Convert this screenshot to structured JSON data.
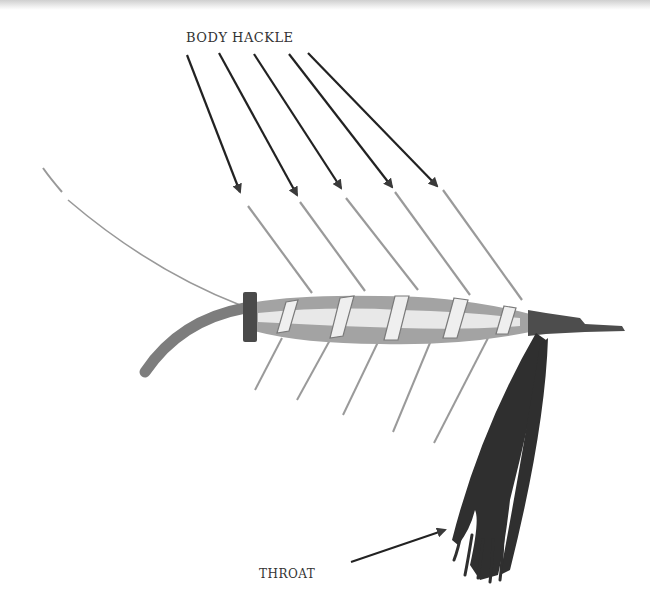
{
  "diagram": {
    "labels": {
      "body_hackle": "BODY HACKLE",
      "throat": "THROAT"
    },
    "parts": [
      {
        "name": "tail",
        "description": "thin curved tail fiber"
      },
      {
        "name": "hook-bend",
        "description": "thick curved shank rear"
      },
      {
        "name": "butt-wrap",
        "description": "dark thread wrap at rear of body"
      },
      {
        "name": "body",
        "description": "tinsel-ribbed body with spiral wraps"
      },
      {
        "name": "body-hackle",
        "description": "five hackle fibers above and below body",
        "count": 5
      },
      {
        "name": "head",
        "description": "dark thread head at hook eye"
      },
      {
        "name": "throat",
        "description": "dark bundle of fibers hanging below head"
      }
    ],
    "arrows": {
      "body_hackle_count": 5,
      "throat_count": 1
    },
    "colors": {
      "ink": "#222222",
      "hackle": "#8a8a8a",
      "body": "#9a9a9a",
      "body_highlight": "#e6e6e6",
      "dark": "#3a3a3a",
      "throat": "#2e2e2e"
    }
  }
}
